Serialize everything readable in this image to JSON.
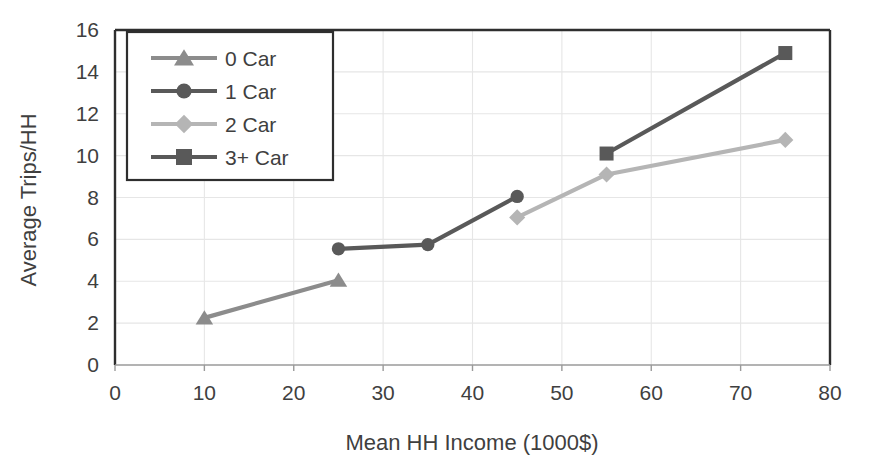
{
  "chart_data": {
    "type": "line",
    "title": "",
    "xlabel": "Mean HH Income (1000$)",
    "ylabel": "Average Trips/HH",
    "xlim": [
      0,
      80
    ],
    "ylim": [
      0,
      16
    ],
    "xticks": [
      0,
      10,
      20,
      30,
      40,
      50,
      60,
      70,
      80
    ],
    "yticks": [
      0,
      2,
      4,
      6,
      8,
      10,
      12,
      14,
      16
    ],
    "grid": true,
    "legend_position": "upper-left",
    "series": [
      {
        "name": "0 Car",
        "marker": "triangle",
        "color": "#8c8c8c",
        "x": [
          10,
          25
        ],
        "y": [
          2.25,
          4.05
        ]
      },
      {
        "name": "1 Car",
        "marker": "circle",
        "color": "#595959",
        "x": [
          25,
          35,
          45
        ],
        "y": [
          5.55,
          5.75,
          8.05
        ]
      },
      {
        "name": "2 Car",
        "marker": "diamond",
        "color": "#b5b5b5",
        "x": [
          45,
          55,
          75
        ],
        "y": [
          7.05,
          9.1,
          10.75
        ]
      },
      {
        "name": "3+ Car",
        "marker": "square",
        "color": "#595959",
        "x": [
          55,
          75
        ],
        "y": [
          10.1,
          14.9
        ]
      }
    ]
  },
  "axes": {
    "x_tick_labels": [
      "0",
      "10",
      "20",
      "30",
      "40",
      "50",
      "60",
      "70",
      "80"
    ],
    "y_tick_labels": [
      "0",
      "2",
      "4",
      "6",
      "8",
      "10",
      "12",
      "14",
      "16"
    ],
    "x_axis_title": "Mean HH Income (1000$)",
    "y_axis_title": "Average Trips/HH"
  },
  "legend": {
    "items": [
      {
        "label": "0 Car"
      },
      {
        "label": "1 Car"
      },
      {
        "label": "2 Car"
      },
      {
        "label": "3+ Car"
      }
    ]
  }
}
